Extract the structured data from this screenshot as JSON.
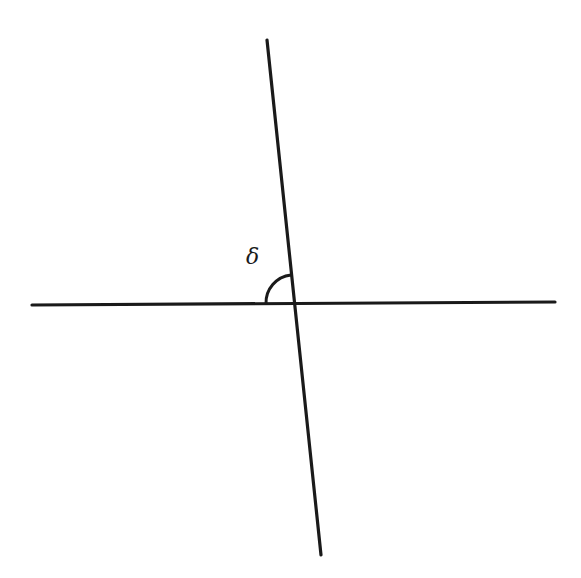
{
  "diagram": {
    "angle_label": "δ",
    "colors": {
      "line": "#1a1a1a",
      "background": "#ffffff"
    },
    "lines": [
      {
        "name": "horizontal-line",
        "x1": 32,
        "y1": 305,
        "x2": 555,
        "y2": 302
      },
      {
        "name": "transversal-line",
        "x1": 267,
        "y1": 40,
        "x2": 321,
        "y2": 555
      }
    ],
    "intersection": {
      "x": 294,
      "y": 303
    },
    "angle_arc": {
      "radius": 28
    }
  }
}
